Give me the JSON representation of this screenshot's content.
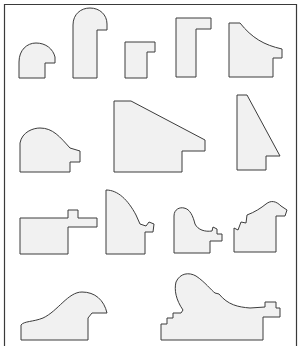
{
  "diagram": {
    "type": "moulding-profile-catalog",
    "frame_color": "#3a3a3a",
    "fill_color": "#f1f1f1",
    "stroke_color": "#3c3c3c",
    "profiles": [
      {
        "id": "profile-1",
        "row": 1,
        "shape": "rounded-top-step"
      },
      {
        "id": "profile-2",
        "row": 1,
        "shape": "tall-rounded-hook"
      },
      {
        "id": "profile-3",
        "row": 1,
        "shape": "small-L"
      },
      {
        "id": "profile-4",
        "row": 1,
        "shape": "tall-L"
      },
      {
        "id": "profile-5",
        "row": 1,
        "shape": "concave-curve-step"
      },
      {
        "id": "profile-6",
        "row": 2,
        "shape": "convex-hump-step"
      },
      {
        "id": "profile-7",
        "row": 2,
        "shape": "slanted-wedge-step"
      },
      {
        "id": "profile-8",
        "row": 2,
        "shape": "tall-slant-step"
      },
      {
        "id": "profile-9",
        "row": 3,
        "shape": "flat-lip-tab"
      },
      {
        "id": "profile-10",
        "row": 3,
        "shape": "quarter-round-ornate"
      },
      {
        "id": "profile-11",
        "row": 3,
        "shape": "ornate-cove"
      },
      {
        "id": "profile-12",
        "row": 3,
        "shape": "ornate-crest"
      },
      {
        "id": "profile-13",
        "row": 4,
        "shape": "wave-swoop"
      },
      {
        "id": "profile-14",
        "row": 4,
        "shape": "wide-ornate-swoop"
      }
    ]
  }
}
